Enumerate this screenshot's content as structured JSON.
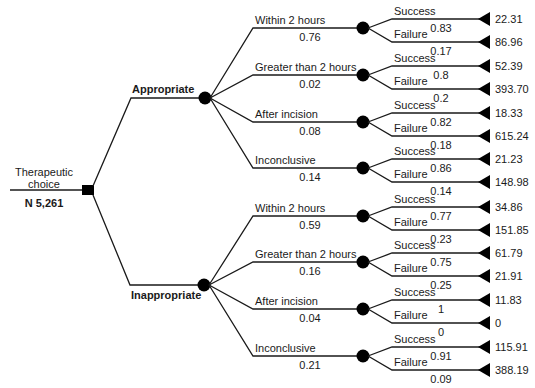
{
  "root": {
    "label_line1": "Therapeutic",
    "label_line2": "choice",
    "n": "N 5,261"
  },
  "branches": [
    {
      "label": "Appropriate",
      "children": [
        {
          "label": "Within 2 hours",
          "prob": "0.76",
          "outcomes": [
            {
              "label": "Success",
              "prob": "0.83",
              "value": "22.31"
            },
            {
              "label": "Failure",
              "prob": "0.17",
              "value": "86.96"
            }
          ]
        },
        {
          "label": "Greater than 2 hours",
          "prob": "0.02",
          "outcomes": [
            {
              "label": "Success",
              "prob": "0.8",
              "value": "52.39"
            },
            {
              "label": "Failure",
              "prob": "0.2",
              "value": "393.70"
            }
          ]
        },
        {
          "label": "After incision",
          "prob": "0.08",
          "outcomes": [
            {
              "label": "Success",
              "prob": "0.82",
              "value": "18.33"
            },
            {
              "label": "Failure",
              "prob": "0.18",
              "value": "615.24"
            }
          ]
        },
        {
          "label": "Inconclusive",
          "prob": "0.14",
          "outcomes": [
            {
              "label": "Success",
              "prob": "0.86",
              "value": "21.23"
            },
            {
              "label": "Failure",
              "prob": "0.14",
              "value": "148.98"
            }
          ]
        }
      ]
    },
    {
      "label": "Inappropriate",
      "children": [
        {
          "label": "Within 2 hours",
          "prob": "0.59",
          "outcomes": [
            {
              "label": "Success",
              "prob": "0.77",
              "value": "34.86"
            },
            {
              "label": "Failure",
              "prob": "0.23",
              "value": "151.85"
            }
          ]
        },
        {
          "label": "Greater than 2 hours",
          "prob": "0.16",
          "outcomes": [
            {
              "label": "Success",
              "prob": "0.75",
              "value": "61.79"
            },
            {
              "label": "Failure",
              "prob": "0.25",
              "value": "21.91"
            }
          ]
        },
        {
          "label": "After incision",
          "prob": "0.04",
          "outcomes": [
            {
              "label": "Success",
              "prob": "1",
              "value": "11.83"
            },
            {
              "label": "Failure",
              "prob": "0",
              "value": "0"
            }
          ]
        },
        {
          "label": "Inconclusive",
          "prob": "0.21",
          "outcomes": [
            {
              "label": "Success",
              "prob": "0.91",
              "value": "115.91"
            },
            {
              "label": "Failure",
              "prob": "0.09",
              "value": "388.19"
            }
          ]
        }
      ]
    }
  ]
}
